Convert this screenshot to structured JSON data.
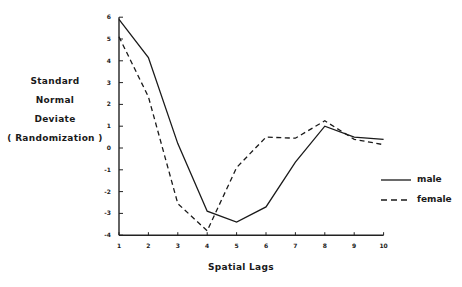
{
  "chart_data": {
    "type": "line",
    "title": "",
    "xlabel": "Spatial Lags",
    "ylabel": [
      "Standard",
      "Normal",
      "Deviate",
      "( Randomization )"
    ],
    "x": [
      1,
      2,
      3,
      4,
      5,
      6,
      7,
      8,
      9,
      10
    ],
    "xticks": [
      "1",
      "2",
      "3",
      "4",
      "5",
      "6",
      "7",
      "8",
      "9",
      "10"
    ],
    "yticks": [
      "6",
      "5",
      "4",
      "3",
      "2",
      "1",
      "0",
      "-1",
      "-2",
      "-3",
      "-4"
    ],
    "ylim": [
      -4,
      6
    ],
    "xlim": [
      1,
      10
    ],
    "grid": false,
    "legend_position": "right",
    "series": [
      {
        "name": "male",
        "style": "solid",
        "values": [
          5.9,
          4.15,
          0.2,
          -2.9,
          -3.4,
          -2.7,
          -0.65,
          1.0,
          0.5,
          0.4
        ]
      },
      {
        "name": "female",
        "style": "dashed",
        "values": [
          5.1,
          2.35,
          -2.55,
          -3.8,
          -0.9,
          0.5,
          0.45,
          1.25,
          0.4,
          0.15
        ]
      }
    ]
  },
  "legend": {
    "male": "male",
    "female": "female"
  }
}
